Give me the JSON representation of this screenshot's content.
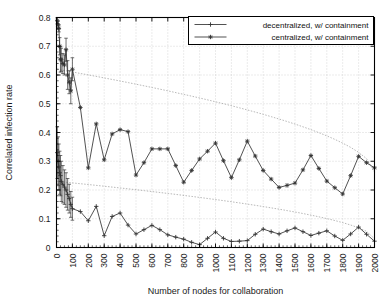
{
  "chart_data": {
    "type": "line",
    "title": "",
    "xlabel": "Number of nodes for collaboration",
    "ylabel": "Correlated infection rate",
    "xlim": [
      0,
      2000
    ],
    "ylim": [
      0,
      0.8
    ],
    "grid": true,
    "legend_position": "top-right",
    "xticks": [
      0,
      100,
      200,
      300,
      400,
      500,
      600,
      700,
      800,
      900,
      1000,
      1100,
      1200,
      1300,
      1400,
      1500,
      1600,
      1700,
      1800,
      1900,
      2000
    ],
    "xtick_labels": [
      "0",
      "100",
      "200",
      "300",
      "400",
      "500",
      "600",
      "700",
      "800",
      "900",
      "1000",
      "1100",
      "1200",
      "1300",
      "1400",
      "1500",
      "1600",
      "1700",
      "1800",
      "1900",
      "2000"
    ],
    "yticks": [
      0,
      0.1,
      0.2,
      0.3,
      0.4,
      0.5,
      0.6,
      0.7,
      0.8
    ],
    "ytick_labels": [
      "0",
      "0.1",
      "0.2",
      "0.3",
      "0.4",
      "0.5",
      "0.6",
      "0.7",
      "0.8"
    ],
    "series": [
      {
        "name": "decentralized, w/ containment",
        "marker": "plus",
        "color": "#333333",
        "x": [
          5,
          10,
          15,
          20,
          25,
          30,
          40,
          50,
          60,
          70,
          80,
          90,
          100,
          150,
          200,
          250,
          300,
          350,
          400,
          450,
          500,
          550,
          600,
          650,
          700,
          750,
          800,
          850,
          900,
          950,
          1000,
          1050,
          1100,
          1150,
          1200,
          1250,
          1300,
          1350,
          1400,
          1450,
          1500,
          1550,
          1600,
          1650,
          1700,
          1750,
          1800,
          1850,
          1900,
          1950,
          2000
        ],
        "values": [
          0.33,
          0.3,
          0.28,
          0.26,
          0.25,
          0.23,
          0.22,
          0.21,
          0.2,
          0.185,
          0.17,
          0.15,
          0.135,
          0.125,
          0.093,
          0.143,
          0.041,
          0.108,
          0.12,
          0.078,
          0.047,
          0.062,
          0.077,
          0.062,
          0.044,
          0.036,
          0.029,
          0.018,
          0.01,
          0.032,
          0.054,
          0.032,
          0.021,
          0.022,
          0.024,
          0.046,
          0.064,
          0.055,
          0.047,
          0.058,
          0.068,
          0.055,
          0.042,
          0.05,
          0.058,
          0.04,
          0.025,
          0.047,
          0.071,
          0.046,
          0.022
        ],
        "errors": [
          0.09,
          0.085,
          0.08,
          0.075,
          0.07,
          0.07,
          0.065,
          0.06,
          0.06,
          0.055,
          0.05,
          0.045,
          0.04,
          0,
          0,
          0,
          0,
          0,
          0,
          0,
          0,
          0,
          0,
          0,
          0,
          0,
          0,
          0,
          0,
          0,
          0,
          0,
          0,
          0,
          0,
          0,
          0,
          0,
          0,
          0,
          0,
          0,
          0,
          0,
          0,
          0,
          0,
          0,
          0,
          0,
          0
        ]
      },
      {
        "name": "centralized, w/ containment",
        "marker": "star",
        "color": "#333333",
        "x": [
          5,
          10,
          15,
          20,
          25,
          30,
          40,
          50,
          60,
          70,
          80,
          90,
          100,
          150,
          200,
          250,
          300,
          350,
          400,
          450,
          500,
          550,
          600,
          650,
          700,
          750,
          800,
          850,
          900,
          950,
          1000,
          1050,
          1100,
          1150,
          1200,
          1250,
          1300,
          1350,
          1400,
          1450,
          1500,
          1550,
          1600,
          1650,
          1700,
          1750,
          1800,
          1850,
          1900,
          1950,
          2000
        ],
        "values": [
          0.79,
          0.775,
          0.762,
          0.7,
          0.655,
          0.653,
          0.64,
          0.635,
          0.688,
          0.6,
          0.575,
          0.545,
          0.62,
          0.487,
          0.277,
          0.43,
          0.305,
          0.395,
          0.41,
          0.403,
          0.252,
          0.295,
          0.343,
          0.343,
          0.343,
          0.285,
          0.227,
          0.268,
          0.308,
          0.335,
          0.363,
          0.302,
          0.243,
          0.305,
          0.37,
          0.318,
          0.268,
          0.238,
          0.209,
          0.216,
          0.224,
          0.27,
          0.32,
          0.275,
          0.231,
          0.208,
          0.186,
          0.25,
          0.317,
          0.295,
          0.277
        ],
        "errors": [
          0.012,
          0.012,
          0.012,
          0.03,
          0.045,
          0.04,
          0.035,
          0.035,
          0.04,
          0.05,
          0.04,
          0.045,
          0.04,
          0,
          0,
          0,
          0,
          0,
          0,
          0,
          0,
          0,
          0,
          0,
          0,
          0,
          0,
          0,
          0,
          0,
          0,
          0,
          0,
          0,
          0,
          0,
          0,
          0,
          0,
          0,
          0,
          0,
          0,
          0,
          0,
          0,
          0,
          0,
          0,
          0,
          0
        ]
      }
    ],
    "trend_lines": [
      {
        "name": "decentralized-trend",
        "x": [
          5,
          2000
        ],
        "values": [
          0.23,
          0.03
        ]
      },
      {
        "name": "centralized-trend",
        "x": [
          5,
          2000
        ],
        "values": [
          0.62,
          0.262
        ]
      }
    ]
  },
  "legend": {
    "entries": [
      {
        "label": "decentralized, w/ containment"
      },
      {
        "label": "centralized, w/ containment"
      }
    ]
  }
}
